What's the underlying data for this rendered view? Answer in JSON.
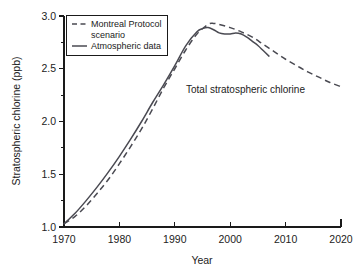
{
  "chart_data": {
    "type": "line",
    "title": "",
    "annotation": "Total stratospheric chlorine",
    "xlabel": "Year",
    "ylabel": "Stratospheric chlorine (ppb)",
    "xlim": [
      1970,
      2020
    ],
    "ylim": [
      1.0,
      3.0
    ],
    "xticks": [
      1970,
      1980,
      1990,
      2000,
      2010,
      2020
    ],
    "xtick_labels": [
      "1970",
      "1980",
      "1990",
      "2000",
      "2010",
      "2020"
    ],
    "yticks": [
      1.0,
      1.5,
      2.0,
      2.5,
      3.0
    ],
    "ytick_labels": [
      "1.0",
      "1.5",
      "2.0",
      "2.5",
      "3.0"
    ],
    "y_minor_ticks": [
      1.25,
      1.75,
      2.25,
      2.75
    ],
    "grid": false,
    "legend_position": "top-left",
    "series": [
      {
        "name": "Montreal Protocol scenario",
        "style": "dashed",
        "color": "#4a4a52",
        "x": [
          1970,
          1972,
          1974,
          1976,
          1978,
          1980,
          1982,
          1984,
          1986,
          1988,
          1990,
          1992,
          1994,
          1996,
          1997,
          1998,
          2000,
          2002,
          2004,
          2006,
          2008,
          2010,
          2012,
          2014,
          2016,
          2018,
          2020
        ],
        "y": [
          1.03,
          1.1,
          1.2,
          1.32,
          1.45,
          1.6,
          1.76,
          1.93,
          2.12,
          2.32,
          2.5,
          2.68,
          2.83,
          2.92,
          2.93,
          2.92,
          2.89,
          2.85,
          2.8,
          2.73,
          2.66,
          2.59,
          2.53,
          2.47,
          2.42,
          2.37,
          2.33
        ]
      },
      {
        "name": "Atmospheric data",
        "style": "solid",
        "color": "#4a4a52",
        "x": [
          1970,
          1972,
          1974,
          1976,
          1978,
          1980,
          1982,
          1984,
          1986,
          1988,
          1990,
          1992,
          1994,
          1995,
          1996,
          1997,
          1998,
          1999,
          2000,
          2001,
          2002,
          2003,
          2004,
          2005,
          2006,
          2007
        ],
        "y": [
          1.03,
          1.13,
          1.25,
          1.38,
          1.52,
          1.67,
          1.83,
          2.0,
          2.18,
          2.35,
          2.53,
          2.72,
          2.85,
          2.88,
          2.89,
          2.87,
          2.84,
          2.83,
          2.83,
          2.84,
          2.83,
          2.8,
          2.76,
          2.72,
          2.67,
          2.62
        ]
      }
    ]
  },
  "legend": {
    "entries": [
      {
        "label_line1": "Montreal Protocol",
        "label_line2": "scenario",
        "style": "dashed"
      },
      {
        "label_line1": "Atmospheric data",
        "label_line2": "",
        "style": "solid"
      }
    ]
  }
}
